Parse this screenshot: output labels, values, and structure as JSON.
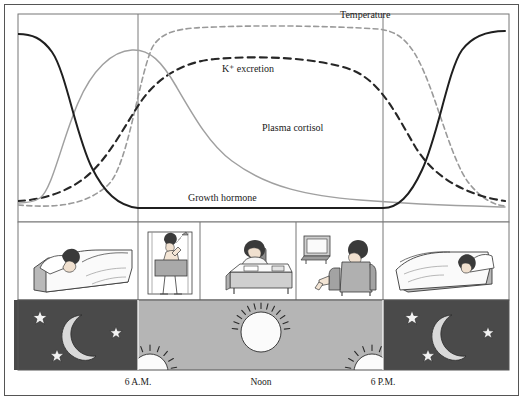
{
  "figure": {
    "title": "",
    "background_color": "#ffffff",
    "frame_color": "#555555",
    "night_color": "#4a4a4a",
    "day_color": "#b5b5b5",
    "gridline_color": "#7a7a7a"
  },
  "axis": {
    "ticks": [
      {
        "id": "dawn",
        "label": "6 A.M.",
        "x_px": 138
      },
      {
        "id": "noon",
        "label": "Noon",
        "x_px": 261
      },
      {
        "id": "dusk",
        "label": "6 P.M.",
        "x_px": 383
      }
    ]
  },
  "curves": [
    {
      "name": "Temperature",
      "label": "Temperature",
      "label_x": 340,
      "label_y": 18,
      "style": "dashed",
      "color": "#9a9a9a",
      "stroke_width": 1.6,
      "dash": "5,3.5",
      "path": "M 18,205 C 55,208 85,206 108,185 C 128,166 138,80 152,48 C 162,29 185,28 215,27 C 265,25 330,26 378,29 C 400,31 412,44 424,72 C 438,104 452,160 468,182 C 482,200 495,205 505,206"
    },
    {
      "name": "K+ excretion",
      "label": "K⁺ excretion",
      "label_x": 222,
      "label_y": 72,
      "style": "dashed",
      "color": "#262626",
      "stroke_width": 2.1,
      "dash": "7,5",
      "path": "M 18,201 C 40,200 62,194 82,180 C 108,161 124,126 142,100 C 158,78 182,62 215,59 C 262,55 320,58 352,70 C 382,82 398,118 416,148 C 436,180 470,196 505,201"
    },
    {
      "name": "Plasma cortisol",
      "label": "Plasma cortisol",
      "label_x": 262,
      "label_y": 131,
      "style": "solid",
      "color": "#a0a0a0",
      "stroke_width": 1.5,
      "dash": "none",
      "path": "M 18,203 C 28,203 34,202 40,198 C 52,190 62,140 78,103 C 92,70 112,51 132,50 C 150,49 162,62 176,86 C 194,117 210,145 232,161 C 268,188 310,196 360,200 C 420,205 470,206 505,207"
    },
    {
      "name": "Growth hormone",
      "label": "Growth hormone",
      "label_x": 188,
      "label_y": 201,
      "style": "solid",
      "color": "#1f1f1f",
      "stroke_width": 2.0,
      "dash": "none",
      "path": "M 18,34 C 32,34 42,38 52,52 C 66,72 76,136 92,168 C 104,192 118,206 138,208 L 383,208 C 398,208 410,196 422,170 C 438,136 448,70 462,50 C 474,34 492,31 505,31"
    }
  ],
  "panels": {
    "activity": [
      {
        "id": "sleep-left",
        "name": "person-sleeping-in-bed",
        "x": 14,
        "w": 124
      },
      {
        "id": "shower",
        "name": "person-taking-shower",
        "x": 138,
        "w": 62
      },
      {
        "id": "desk-work",
        "name": "person-working-at-desk",
        "x": 200,
        "w": 96
      },
      {
        "id": "watching-tv",
        "name": "person-watching-television",
        "x": 296,
        "w": 87
      },
      {
        "id": "sleep-right",
        "name": "person-sleeping-in-bed",
        "x": 383,
        "w": 126
      }
    ],
    "sky": [
      {
        "id": "night-left",
        "phase": "night",
        "x": 14,
        "w": 124
      },
      {
        "id": "day",
        "phase": "day",
        "x": 138,
        "w": 245
      },
      {
        "id": "night-right",
        "phase": "night",
        "x": 383,
        "w": 126
      }
    ],
    "sky_icons": [
      {
        "id": "moon-left",
        "name": "crescent-moon-icon",
        "cx": 73,
        "cy": 336
      },
      {
        "id": "star-left-1",
        "name": "star-icon",
        "cx": 40,
        "cy": 318,
        "r": 7.5
      },
      {
        "id": "star-left-2",
        "name": "star-icon",
        "cx": 116,
        "cy": 333,
        "r": 6.5
      },
      {
        "id": "star-left-3",
        "name": "star-icon",
        "cx": 57,
        "cy": 356,
        "r": 7.0
      },
      {
        "id": "sun-dawn",
        "name": "sun-rising-icon",
        "cx": 150,
        "cy": 372
      },
      {
        "id": "sun-noon",
        "name": "sun-high-icon",
        "cx": 261,
        "cy": 332
      },
      {
        "id": "sun-dusk",
        "name": "sun-setting-icon",
        "cx": 372,
        "cy": 372
      },
      {
        "id": "moon-right",
        "name": "crescent-moon-icon",
        "cx": 443,
        "cy": 336
      },
      {
        "id": "star-right-1",
        "name": "star-icon",
        "cx": 412,
        "cy": 318,
        "r": 7.5
      },
      {
        "id": "star-right-2",
        "name": "star-icon",
        "cx": 488,
        "cy": 333,
        "r": 6.5
      },
      {
        "id": "star-right-3",
        "name": "star-icon",
        "cx": 428,
        "cy": 356,
        "r": 7.0
      }
    ]
  },
  "chart_data": {
    "type": "line",
    "title": "",
    "xlabel": "",
    "ylabel": "",
    "grid": false,
    "legend": "inline-annotations",
    "x": [
      "Midnight",
      "3 A.M.",
      "6 A.M.",
      "9 A.M.",
      "Noon",
      "3 P.M.",
      "6 P.M.",
      "9 P.M.",
      "Midnight"
    ],
    "xtick_labels": [
      "6 A.M.",
      "Noon",
      "6 P.M."
    ],
    "ylim": [
      0,
      100
    ],
    "series": [
      {
        "name": "Temperature",
        "style": "dashed",
        "color": "#9a9a9a",
        "values": [
          5,
          4,
          25,
          92,
          96,
          95,
          90,
          45,
          6
        ]
      },
      {
        "name": "K+ excretion",
        "style": "dashed",
        "color": "#262626",
        "values": [
          8,
          14,
          48,
          76,
          80,
          78,
          62,
          24,
          8
        ]
      },
      {
        "name": "Plasma cortisol",
        "style": "solid",
        "color": "#a0a0a0",
        "values": [
          6,
          22,
          88,
          66,
          40,
          22,
          12,
          7,
          5
        ]
      },
      {
        "name": "Growth hormone",
        "style": "solid",
        "color": "#1f1f1f",
        "values": [
          96,
          62,
          4,
          2,
          2,
          2,
          2,
          48,
          92
        ]
      }
    ],
    "annotations": [
      {
        "text": "Temperature",
        "x": "3 P.M.",
        "y": 99
      },
      {
        "text": "K⁺ excretion",
        "x": "9 A.M.",
        "y": 80
      },
      {
        "text": "Plasma cortisol",
        "x": "Noon",
        "y": 42
      },
      {
        "text": "Growth hormone",
        "x": "9 A.M.",
        "y": 4
      }
    ]
  }
}
